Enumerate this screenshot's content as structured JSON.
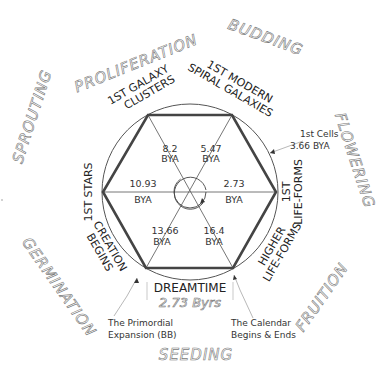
{
  "diagram": {
    "type": "hexagonal cycle",
    "colors": {
      "hexagon": "#444444",
      "circle": "#555555",
      "spokes": "#666666",
      "season_text": "#777777",
      "leader_lines": "#999999"
    }
  },
  "seasons": {
    "proliferation": "PROLIFERATION",
    "budding": "BUDDING",
    "flowering": "FLOWERING",
    "fruition": "FRUITION",
    "seeding": "SEEDING",
    "germination": "GERMINATION",
    "sprouting": "SPROUTING"
  },
  "stages": {
    "galaxy_clusters": {
      "line1": "1ST GALAXY",
      "line2": "CLUSTERS"
    },
    "spiral_galaxies": {
      "line1": "1ST MODERN",
      "line2": "SPIRAL GALAXIES"
    },
    "life_forms": {
      "line1": "1ST",
      "line2": "LIFE-FORMS"
    },
    "higher_life": {
      "line1": "HIGHER",
      "line2": "LIFE-FORMS"
    },
    "dreamtime": {
      "line1": "DREAMTIME",
      "line2": "2.73 Byrs"
    },
    "creation": {
      "line1": "CREATION",
      "line2": "BEGINS"
    },
    "stars": {
      "line1": "1ST STARS"
    }
  },
  "spoke_values": {
    "upper_left": {
      "value": "8.2",
      "unit": "BYA"
    },
    "upper_right": {
      "value": "5.47",
      "unit": "BYA"
    },
    "left": {
      "value": "10.93",
      "unit": "BYA"
    },
    "right": {
      "value": "2.73",
      "unit": "BYA"
    },
    "lower_left": {
      "value": "13.66",
      "unit": "BYA"
    },
    "lower_right": {
      "value": "16.4",
      "unit": "BYA"
    }
  },
  "annotations": {
    "first_cells": {
      "line1": "1st Cells",
      "line2": "3.66 BYA"
    },
    "primordial": {
      "line1": "The Primordial",
      "line2": "Expansion (BB)"
    },
    "calendar": {
      "line1": "The Calendar",
      "line2": "Begins & Ends"
    }
  }
}
